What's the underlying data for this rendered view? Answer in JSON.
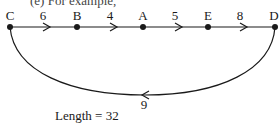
{
  "caption": "(e) For example,",
  "nodes": [
    {
      "id": "C",
      "label": "C",
      "x": 10,
      "y": 27
    },
    {
      "id": "B",
      "label": "B",
      "x": 77,
      "y": 27
    },
    {
      "id": "A",
      "label": "A",
      "x": 143,
      "y": 27
    },
    {
      "id": "E",
      "label": "E",
      "x": 208,
      "y": 27
    },
    {
      "id": "D",
      "label": "D",
      "x": 275,
      "y": 27
    }
  ],
  "edges": [
    {
      "from": "C",
      "to": "B",
      "weight": "6",
      "label_x": 43
    },
    {
      "from": "B",
      "to": "A",
      "weight": "4",
      "label_x": 110
    },
    {
      "from": "A",
      "to": "E",
      "weight": "5",
      "label_x": 175
    },
    {
      "from": "E",
      "to": "D",
      "weight": "8",
      "label_x": 240
    },
    {
      "from": "D",
      "to": "C",
      "weight": "9",
      "label_x": 145,
      "curved": true
    }
  ],
  "result": {
    "text": "Length = 32"
  },
  "colors": {
    "stroke": "#1a1a1a",
    "background": "#ffffff"
  }
}
